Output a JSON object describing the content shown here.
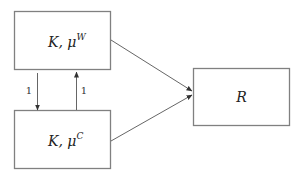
{
  "diagram": {
    "nodes": [
      {
        "id": "node-w",
        "label_main": "K, μ",
        "label_sup": "W"
      },
      {
        "id": "node-c",
        "label_main": "K, μ",
        "label_sup": "C"
      },
      {
        "id": "node-r",
        "label_main": "R",
        "label_sup": ""
      }
    ],
    "edges": [
      {
        "from": "node-w",
        "to": "node-c",
        "label": "1"
      },
      {
        "from": "node-c",
        "to": "node-w",
        "label": "1"
      },
      {
        "from": "node-w",
        "to": "node-r",
        "label": ""
      },
      {
        "from": "node-c",
        "to": "node-r",
        "label": ""
      }
    ]
  }
}
